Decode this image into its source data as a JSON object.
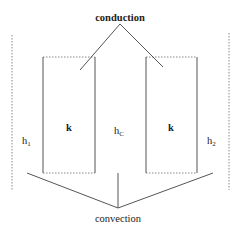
{
  "diagram": {
    "labels": {
      "conduction": "conduction",
      "convection": "convection",
      "left_box_k": "k",
      "right_box_k": "k",
      "h_center_main": "h",
      "h_center_sub": "C",
      "h_left_main": "h",
      "h_left_sub": "1",
      "h_right_main": "h",
      "h_right_sub": "2"
    },
    "colors": {
      "line": "#555555",
      "dotted": "#888888",
      "text": "#222222"
    }
  }
}
